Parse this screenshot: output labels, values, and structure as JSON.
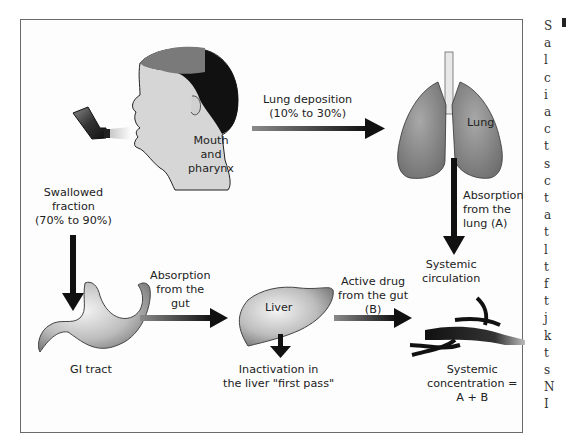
{
  "diagram": {
    "labels": {
      "mouth": [
        "Mouth",
        "and",
        "pharynx"
      ],
      "lung_deposition": [
        "Lung deposition",
        "(10% to 30%)"
      ],
      "lung": "Lung",
      "absorption_lung": [
        "Absorption",
        "from the",
        "lung (A)"
      ],
      "swallowed": [
        "Swallowed",
        "fraction",
        "(70% to 90%)"
      ],
      "absorption_gut": [
        "Absorption",
        "from the",
        "gut"
      ],
      "liver": "Liver",
      "active_drug": [
        "Active drug",
        "from the gut",
        "(B)"
      ],
      "systemic_circulation": [
        "Systemic",
        "circulation"
      ],
      "gi_tract": "GI tract",
      "inactivation": [
        "Inactivation in",
        "the liver \"first pass\""
      ],
      "systemic_concentration": [
        "Systemic",
        "concentration =",
        "A + B"
      ]
    },
    "nodes": [
      "inhaler",
      "head",
      "lungs",
      "stomach",
      "liver",
      "blood-vessels"
    ],
    "edges": [
      {
        "from": "mouth",
        "to": "lung",
        "label": "Lung deposition (10% to 30%)"
      },
      {
        "from": "mouth",
        "to": "gi-tract",
        "label": "Swallowed fraction (70% to 90%)"
      },
      {
        "from": "lung",
        "to": "systemic-circulation",
        "label": "Absorption from the lung (A)"
      },
      {
        "from": "gi-tract",
        "to": "liver",
        "label": "Absorption from the gut"
      },
      {
        "from": "liver",
        "to": "systemic-circulation",
        "label": "Active drug from the gut (B)"
      },
      {
        "from": "liver",
        "to": "inactivation",
        "label": "Inactivation in the liver \"first pass\""
      }
    ],
    "colors": {
      "frame": "#6a6a6a",
      "skin": "#d9d9d9",
      "hair_dark": "#111111",
      "hair_light": "#7a7a7a",
      "lung": "#8a8a8a",
      "arrow": "#111111"
    }
  },
  "sidebar_text": {
    "chars": [
      "S",
      "a",
      "l",
      "c",
      "i",
      "a",
      "c",
      "t",
      "s",
      "c",
      "t",
      "a",
      "t",
      "l",
      "t",
      "f",
      "t",
      "j",
      "k",
      "t",
      "s",
      "N",
      "I"
    ]
  }
}
